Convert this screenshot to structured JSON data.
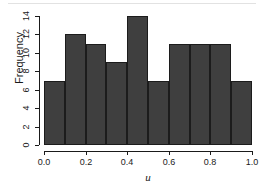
{
  "chart_data": {
    "type": "bar",
    "title": "",
    "subtitle": "",
    "xlabel": "u",
    "ylabel": "Frequency",
    "categories": [
      "0.0-0.1",
      "0.1-0.2",
      "0.2-0.3",
      "0.3-0.4",
      "0.4-0.5",
      "0.5-0.6",
      "0.6-0.7",
      "0.7-0.8",
      "0.8-0.9",
      "0.9-1.0"
    ],
    "bin_edges": [
      0.0,
      0.1,
      0.2,
      0.3,
      0.4,
      0.5,
      0.6,
      0.7,
      0.8,
      0.9,
      1.0
    ],
    "values": [
      7,
      12,
      11,
      9,
      14,
      7,
      11,
      11,
      11,
      7
    ],
    "xlim": [
      0.0,
      1.0
    ],
    "ylim": [
      0,
      14
    ],
    "xticks": [
      0.0,
      0.2,
      0.4,
      0.6,
      0.8,
      1.0
    ],
    "xtick_labels": [
      "0.0",
      "0.2",
      "0.4",
      "0.6",
      "0.8",
      "1.0"
    ],
    "yticks": [
      0,
      2,
      4,
      6,
      8,
      10,
      12,
      14
    ],
    "ytick_labels": [
      "0",
      "2",
      "4",
      "6",
      "8",
      "10",
      "12",
      "14"
    ],
    "grid": false,
    "legend": null,
    "legend_position": "none",
    "bar_fill_color": "#3f3f3f",
    "bar_border_color": "#1c1c1c",
    "axis_color": "#1a1a1a",
    "background_color": "#ffffff",
    "top_rule_color": "#e2e2e2"
  }
}
